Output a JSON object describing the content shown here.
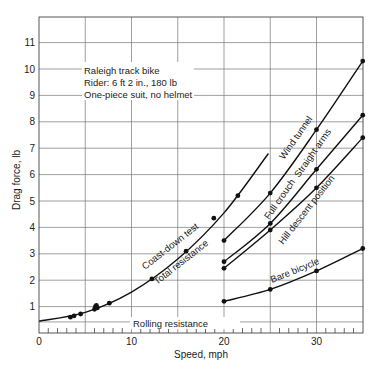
{
  "chart_data": {
    "type": "line",
    "title": "",
    "xlabel": "Speed, mph",
    "ylabel": "Drag force, lb",
    "xlim": [
      0,
      35
    ],
    "ylim": [
      0,
      11.6
    ],
    "x_ticks": [
      0,
      10,
      20,
      30
    ],
    "y_ticks": [
      1,
      2,
      3,
      4,
      5,
      6,
      7,
      8,
      9,
      10,
      11
    ],
    "grid": true,
    "legend": "none (curves labeled inline)",
    "annotation_box": [
      "Raleigh track bike",
      "Rider: 6 ft 2 in., 180 lb",
      "One-piece suit, no helmet"
    ],
    "series": [
      {
        "name": "Coast-down test / Total resistance",
        "curve": [
          [
            0,
            0.45
          ],
          [
            5,
            0.78
          ],
          [
            10,
            1.55
          ],
          [
            15,
            2.8
          ],
          [
            20,
            4.55
          ],
          [
            24.8,
            6.8
          ]
        ],
        "points": [
          [
            3.4,
            0.6
          ],
          [
            3.8,
            0.65
          ],
          [
            4.5,
            0.72
          ],
          [
            6.0,
            0.9
          ],
          [
            6.1,
            1.0
          ],
          [
            6.2,
            1.05
          ],
          [
            6.3,
            0.95
          ],
          [
            7.6,
            1.13
          ],
          [
            12.2,
            2.05
          ],
          [
            15.9,
            3.1
          ],
          [
            18.9,
            4.35
          ],
          [
            21.5,
            5.2
          ]
        ]
      },
      {
        "name": "Full crouch (Wind tunnel)",
        "points": [
          [
            20,
            3.5
          ],
          [
            25,
            5.3
          ],
          [
            30,
            7.7
          ],
          [
            35,
            10.3
          ]
        ]
      },
      {
        "name": "Straight arms (Wind tunnel)",
        "points": [
          [
            20,
            2.7
          ],
          [
            25,
            4.15
          ],
          [
            30,
            6.2
          ],
          [
            35,
            8.25
          ]
        ]
      },
      {
        "name": "Hill descent position (Wind tunnel)",
        "points": [
          [
            20,
            2.45
          ],
          [
            25,
            3.9
          ],
          [
            30,
            5.5
          ],
          [
            35,
            7.4
          ]
        ]
      },
      {
        "name": "Bare bicycle",
        "points": [
          [
            20,
            1.2
          ],
          [
            25,
            1.65
          ],
          [
            30,
            2.35
          ],
          [
            35,
            3.2
          ]
        ]
      },
      {
        "name": "Rolling resistance",
        "constant": 0.42
      }
    ],
    "curve_labels": {
      "coast_down": "Coast-down test",
      "total": "Total resistance",
      "wind_tunnel": "Wind tunnel",
      "full_crouch": "Full crouch",
      "straight_arms": "Straight arms",
      "hill_descent": "Hill descent position",
      "bare_bicycle": "Bare bicycle",
      "rolling": "Rolling resistance"
    }
  }
}
